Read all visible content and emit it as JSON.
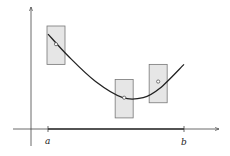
{
  "diagram": {
    "labels": {
      "a": "a",
      "b": "b"
    },
    "colors": {
      "curve": "#222222",
      "rect_fill": "#e6e6e6",
      "rect_stroke": "#777777",
      "axis": "#444444"
    },
    "curve_points": [
      [
        0,
        0.92
      ],
      [
        0.15,
        0.7
      ],
      [
        0.35,
        0.45
      ],
      [
        0.55,
        0.29
      ],
      [
        0.7,
        0.29
      ],
      [
        0.82,
        0.38
      ],
      [
        1,
        0.62
      ]
    ],
    "sample_points": [
      {
        "x": 0.0,
        "y": 0.82,
        "rect_low": 0.62,
        "rect_high": 1.0
      },
      {
        "x": 0.56,
        "y": 0.29,
        "rect_low": 0.09,
        "rect_high": 0.47
      },
      {
        "x": 0.81,
        "y": 0.45,
        "rect_low": 0.24,
        "rect_high": 0.62
      }
    ]
  }
}
